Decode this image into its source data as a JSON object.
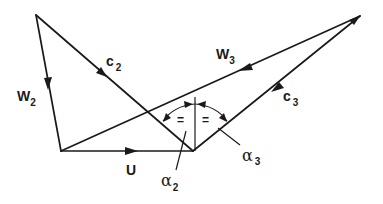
{
  "diagram": {
    "type": "velocity-triangles",
    "labels": {
      "w2": {
        "main": "W",
        "sub": "2"
      },
      "c2": {
        "main": "c",
        "sub": "2"
      },
      "w3": {
        "main": "W",
        "sub": "3"
      },
      "c3": {
        "main": "c",
        "sub": "3"
      },
      "u": {
        "main": "U"
      },
      "alpha2": {
        "main": "α",
        "sub": "2"
      },
      "alpha3": {
        "main": "α",
        "sub": "3"
      }
    },
    "equal_marks": [
      "=",
      "="
    ],
    "stroke_color": "#1a1a1a",
    "background": "#ffffff"
  }
}
